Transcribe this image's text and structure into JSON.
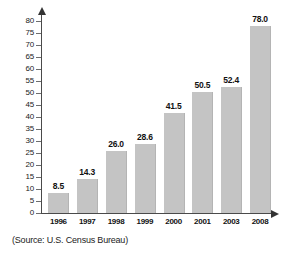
{
  "chart_data": {
    "type": "bar",
    "title": "",
    "xlabel": "",
    "ylabel": "",
    "categories": [
      "1996",
      "1997",
      "1998",
      "1999",
      "2000",
      "2001",
      "2003",
      "2008"
    ],
    "values": [
      8.5,
      14.3,
      26.0,
      28.6,
      41.5,
      50.5,
      52.4,
      78.0
    ],
    "value_labels": [
      "8.5",
      "14.3",
      "26.0",
      "28.6",
      "41.5",
      "50.5",
      "52.4",
      "78.0"
    ],
    "ylim": [
      0,
      80
    ],
    "ytick_step": 5,
    "ytick_labels": [
      "80",
      "75",
      "70",
      "65",
      "60",
      "55",
      "50",
      "45",
      "40",
      "35",
      "30",
      "25",
      "20",
      "15",
      "10",
      "5",
      "0"
    ],
    "grid": false,
    "legend": "none",
    "bar_color": "#c4c4c4",
    "axis_color": "#4a4a4a"
  },
  "annotations": {
    "source_note": "(Source: U.S. Census Bureau)"
  }
}
